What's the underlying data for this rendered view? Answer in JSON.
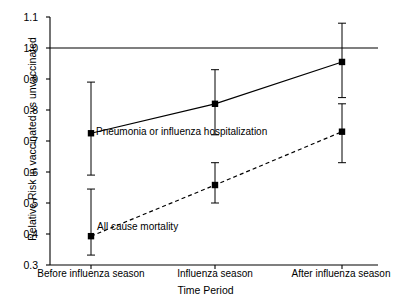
{
  "chart_data": {
    "type": "line",
    "title": "",
    "xlabel": "Time Period",
    "ylabel": "Relative Risk in vaccinated vs unvaccinated",
    "categories": [
      "Before influenza season",
      "Influenza season",
      "After influenza season"
    ],
    "ylim": [
      0.3,
      1.1
    ],
    "yticks": [
      "0.3",
      "0.4",
      "0.5",
      "0.6",
      "0.7",
      "0.8",
      "0.9",
      "1.0",
      "1.1"
    ],
    "ytick_values": [
      0.3,
      0.4,
      0.5,
      0.6,
      0.7,
      0.8,
      0.9,
      1.0,
      1.1
    ],
    "grid": false,
    "legend_position": "inline-annotations",
    "reference_line": {
      "y": 1.0,
      "style": "solid",
      "color": "#000000"
    },
    "series": [
      {
        "name": "Pneumonia or influenza hospitalization",
        "style": "solid",
        "marker": "square",
        "color": "#000000",
        "values": [
          0.725,
          0.82,
          0.955
        ],
        "ci_lower": [
          0.59,
          0.72,
          0.84
        ],
        "ci_upper": [
          0.89,
          0.93,
          1.08
        ]
      },
      {
        "name": "All cause mortality",
        "style": "dashed",
        "marker": "square",
        "color": "#000000",
        "values": [
          0.393,
          0.558,
          0.73
        ],
        "ci_lower": [
          0.332,
          0.5,
          0.63
        ],
        "ci_upper": [
          0.545,
          0.63,
          0.82
        ]
      }
    ],
    "annotations": [
      {
        "text": "Pneumonia or influenza hospitalization",
        "x": 0.21,
        "y": 0.705
      },
      {
        "text": "All cause mortality",
        "x": 0.235,
        "y": 0.395
      }
    ]
  },
  "colors": {
    "axis": "#000000",
    "line": "#000000",
    "background": "#ffffff"
  }
}
